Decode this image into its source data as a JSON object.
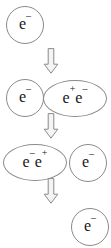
{
  "figure": {
    "background_color": "#ffffff",
    "stroke_color": "#8a8a8a",
    "text_color": "#171717",
    "arrow_fill": "#f2f2f2",
    "arrow_stroke": "#8a8a8a"
  },
  "steps": [
    {
      "index": 1,
      "arrow_label": "downward-arrow",
      "particles": [
        {
          "id": "r1-e",
          "shape": "circle",
          "base": "e",
          "charge": "−",
          "label": "e⁻"
        }
      ]
    },
    {
      "index": 2,
      "arrow_label": "downward-arrow",
      "particles": [
        {
          "id": "r2-e",
          "shape": "circle",
          "base": "e",
          "charge": "−",
          "label": "e⁻"
        },
        {
          "id": "r2-pair",
          "shape": "ellipse",
          "base": "ee",
          "charge": "+−",
          "label": "e⁺e⁻"
        }
      ]
    },
    {
      "index": 3,
      "arrow_label": "downward-arrow",
      "particles": [
        {
          "id": "r3-pair",
          "shape": "ellipse",
          "base": "ee",
          "charge": "−+",
          "label": "e⁻e⁺"
        },
        {
          "id": "r3-e",
          "shape": "circle",
          "base": "e",
          "charge": "−",
          "label": "e⁻"
        }
      ]
    },
    {
      "index": 4,
      "particles": [
        {
          "id": "r4-e",
          "shape": "circle",
          "base": "e",
          "charge": "−",
          "label": "e⁻"
        }
      ]
    }
  ],
  "labels": {
    "e_base": "e",
    "minus": "−",
    "plus": "+",
    "r1_e": {
      "base": "e",
      "sup": "–"
    },
    "r2_e": {
      "base": "e",
      "sup": "–"
    },
    "r2_pair": {
      "base1": "e",
      "sup1": "+",
      "base2": "e",
      "sup2": "–"
    },
    "r3_pair": {
      "base1": "e",
      "sup1": "–",
      "base2": "e",
      "sup2": "+"
    },
    "r3_e": {
      "base": "e",
      "sup": "–"
    },
    "r4_e": {
      "base": "e",
      "sup": "–"
    }
  },
  "arrows": [
    {
      "id": "arrow-1",
      "direction": "down"
    },
    {
      "id": "arrow-2",
      "direction": "down"
    },
    {
      "id": "arrow-3",
      "direction": "down"
    }
  ]
}
